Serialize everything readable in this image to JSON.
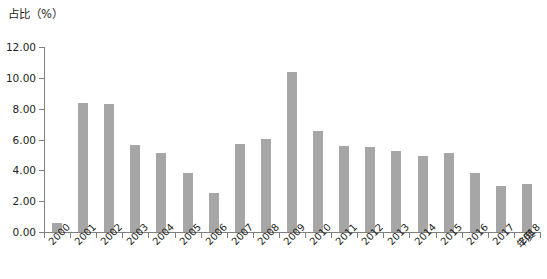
{
  "chart_data": {
    "type": "bar",
    "title": "",
    "ylabel": "占比（%）",
    "xlabel": "年度",
    "ylim": [
      0,
      12
    ],
    "ytick_step": 2,
    "ytick_labels": [
      "0.00",
      "2.00",
      "4.00",
      "6.00",
      "8.00",
      "10.00",
      "12.00"
    ],
    "grid": false,
    "legend": null,
    "bar_color": "#a6a6a6",
    "axis_color": "#808080",
    "categories": [
      "2000",
      "2001",
      "2002",
      "2003",
      "2004",
      "2005",
      "2006",
      "2007",
      "2008",
      "2009",
      "2010",
      "2011",
      "2012",
      "2013",
      "2014",
      "2015",
      "2016",
      "2017",
      "2018"
    ],
    "values": [
      0.6,
      8.35,
      8.3,
      5.65,
      5.1,
      3.85,
      2.5,
      5.7,
      6.05,
      10.4,
      6.55,
      5.6,
      5.5,
      5.25,
      4.9,
      5.1,
      3.8,
      3.0,
      3.1
    ]
  },
  "caption": {
    "text": ""
  }
}
